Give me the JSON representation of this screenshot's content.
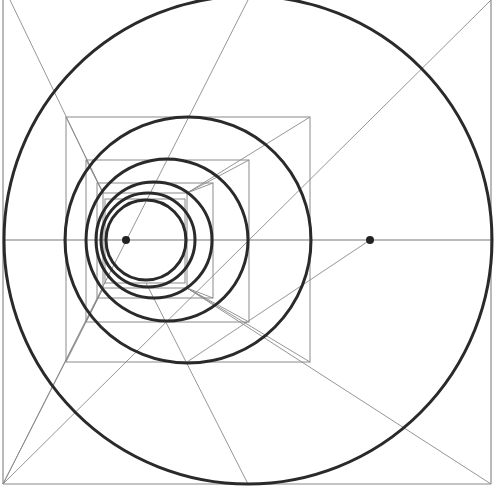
{
  "diagram": {
    "title": "",
    "colors": {
      "background": "#ffffff",
      "construction_line": "#8a8a8a",
      "circle_stroke": "#2a2a2a",
      "dot": "#222222"
    },
    "frame": {
      "x1": 3,
      "y1": 0,
      "x2": 491,
      "y2": 484
    },
    "axis": {
      "y": 240,
      "x1": 3,
      "x2": 491
    },
    "squares": [
      {
        "x": 66,
        "y": 117,
        "w": 244,
        "h": 245
      },
      {
        "x": 86,
        "y": 160,
        "w": 163,
        "h": 162
      },
      {
        "x": 97,
        "y": 183,
        "w": 116,
        "h": 115
      },
      {
        "x": 103,
        "y": 193,
        "w": 84,
        "h": 95
      },
      {
        "x": 105,
        "y": 199,
        "w": 80,
        "h": 84
      }
    ],
    "circles": [
      {
        "cx": 248,
        "cy": 240,
        "r": 244
      },
      {
        "cx": 188,
        "cy": 240,
        "r": 123
      },
      {
        "cx": 167,
        "cy": 240,
        "r": 81
      },
      {
        "cx": 154,
        "cy": 240,
        "r": 58
      },
      {
        "cx": 148,
        "cy": 240,
        "r": 47
      },
      {
        "cx": 146,
        "cy": 240,
        "r": 40
      }
    ],
    "lines": [
      {
        "x1": 3,
        "y1": 484,
        "x2": 491,
        "y2": 0
      },
      {
        "x1": 3,
        "y1": 484,
        "x2": 248,
        "y2": 0
      },
      {
        "x1": 10,
        "y1": 0,
        "x2": 103,
        "y2": 193
      },
      {
        "x1": 66,
        "y1": 117,
        "x2": 103,
        "y2": 193
      },
      {
        "x1": 3,
        "y1": 484,
        "x2": 103,
        "y2": 288
      },
      {
        "x1": 66,
        "y1": 362,
        "x2": 103,
        "y2": 288
      },
      {
        "x1": 491,
        "y1": 484,
        "x2": 187,
        "y2": 288
      },
      {
        "x1": 310,
        "y1": 362,
        "x2": 187,
        "y2": 288
      },
      {
        "x1": 248,
        "y1": 484,
        "x2": 146,
        "y2": 283
      },
      {
        "x1": 370,
        "y1": 240,
        "x2": 187,
        "y2": 362
      },
      {
        "x1": 310,
        "y1": 117,
        "x2": 187,
        "y2": 193
      },
      {
        "x1": 249,
        "y1": 160,
        "x2": 187,
        "y2": 193
      },
      {
        "x1": 86,
        "y1": 160,
        "x2": 103,
        "y2": 193
      },
      {
        "x1": 86,
        "y1": 322,
        "x2": 103,
        "y2": 288
      },
      {
        "x1": 249,
        "y1": 322,
        "x2": 187,
        "y2": 288
      },
      {
        "x1": 213,
        "y1": 183,
        "x2": 187,
        "y2": 193
      },
      {
        "x1": 213,
        "y1": 298,
        "x2": 187,
        "y2": 288
      }
    ],
    "dots": [
      {
        "cx": 126,
        "cy": 240,
        "r": 4
      },
      {
        "cx": 370,
        "cy": 240,
        "r": 4
      }
    ]
  }
}
